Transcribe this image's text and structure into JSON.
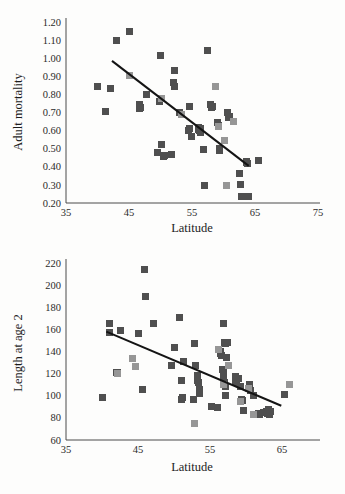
{
  "figure": {
    "background_color": "#fdfdfc",
    "marker_dark_color": "#4f4f4f",
    "marker_light_color": "#969696",
    "axis_color": "#4a4a4a",
    "trend_color": "#141414"
  },
  "chart_data": [
    {
      "type": "scatter",
      "title": "",
      "xlabel": "Latitude",
      "ylabel": "Adult mortality",
      "xlim": [
        35,
        75
      ],
      "ylim": [
        0.2,
        1.2
      ],
      "xticks": [
        35,
        45,
        55,
        65,
        75
      ],
      "yticks": [
        "0.20",
        "0.30",
        "0.40",
        "0.50",
        "0.60",
        "0.70",
        "0.80",
        "0.90",
        "1.00",
        "1.10",
        "1.20"
      ],
      "grid": false,
      "legend": "none",
      "series": [
        {
          "name": "dark",
          "color": "#4f4f4f",
          "points": [
            [
              40.0,
              0.845
            ],
            [
              41.2,
              0.705
            ],
            [
              42.0,
              0.83
            ],
            [
              43.0,
              1.1
            ],
            [
              45.0,
              1.145
            ],
            [
              46.6,
              0.745
            ],
            [
              46.7,
              0.72
            ],
            [
              46.8,
              0.728
            ],
            [
              47.8,
              0.8
            ],
            [
              49.6,
              0.48
            ],
            [
              49.9,
              0.76
            ],
            [
              50.0,
              1.015
            ],
            [
              50.2,
              0.522
            ],
            [
              50.5,
              0.455
            ],
            [
              50.6,
              0.46
            ],
            [
              51.8,
              0.47
            ],
            [
              52.2,
              0.93
            ],
            [
              52.0,
              0.868
            ],
            [
              52.3,
              0.845
            ],
            [
              53.0,
              0.7
            ],
            [
              54.6,
              0.735
            ],
            [
              54.5,
              0.6
            ],
            [
              54.6,
              0.612
            ],
            [
              54.9,
              0.565
            ],
            [
              56.0,
              0.605
            ],
            [
              56.1,
              0.618
            ],
            [
              56.2,
              0.6
            ],
            [
              56.3,
              0.59
            ],
            [
              56.4,
              0.612
            ],
            [
              56.9,
              0.495
            ],
            [
              57.0,
              0.297
            ],
            [
              57.5,
              1.04
            ],
            [
              58.0,
              0.745
            ],
            [
              58.1,
              0.728
            ],
            [
              58.3,
              0.735
            ],
            [
              59.0,
              0.645
            ],
            [
              59.2,
              0.628
            ],
            [
              59.3,
              0.49
            ],
            [
              59.4,
              0.5
            ],
            [
              60.6,
              0.7
            ],
            [
              60.8,
              0.672
            ],
            [
              60.9,
              0.68
            ],
            [
              62.6,
              0.362
            ],
            [
              62.7,
              0.3
            ],
            [
              62.8,
              0.235
            ],
            [
              63.6,
              0.425
            ],
            [
              63.7,
              0.432
            ],
            [
              63.8,
              0.418
            ],
            [
              63.9,
              0.235
            ],
            [
              65.6,
              0.435
            ]
          ]
        },
        {
          "name": "light",
          "color": "#969696",
          "points": [
            [
              45.0,
              0.905
            ],
            [
              50.2,
              0.78
            ],
            [
              53.3,
              0.69
            ],
            [
              58.8,
              0.845
            ],
            [
              59.2,
              0.62
            ],
            [
              60.1,
              0.545
            ],
            [
              60.5,
              0.297
            ],
            [
              61.6,
              0.65
            ]
          ]
        }
      ],
      "trend_line": {
        "x0": 42.3,
        "y0": 0.985,
        "x1": 64.0,
        "y1": 0.405
      }
    },
    {
      "type": "scatter",
      "title": "",
      "xlabel": "Latitude",
      "ylabel": "Length at age 2",
      "xlim": [
        35,
        70
      ],
      "ylim": [
        60,
        220
      ],
      "xticks": [
        35,
        45,
        55,
        65
      ],
      "yticks": [
        60,
        80,
        100,
        120,
        140,
        160,
        180,
        200,
        220
      ],
      "grid": false,
      "legend": "none",
      "series": [
        {
          "name": "dark",
          "color": "#4f4f4f",
          "points": [
            [
              40.0,
              98
            ],
            [
              41.0,
              165
            ],
            [
              41.1,
              157
            ],
            [
              42.0,
              121
            ],
            [
              42.1,
              121
            ],
            [
              42.6,
              159
            ],
            [
              45.0,
              156
            ],
            [
              45.6,
              106
            ],
            [
              45.9,
              214
            ],
            [
              46.0,
              190
            ],
            [
              47.2,
              165
            ],
            [
              49.7,
              127
            ],
            [
              50.0,
              144
            ],
            [
              51.3,
              131
            ],
            [
              51.0,
              114
            ],
            [
              51.1,
              97
            ],
            [
              51.2,
              98
            ],
            [
              50.8,
              171
            ],
            [
              52.8,
              147
            ],
            [
              53.0,
              127
            ],
            [
              52.7,
              97
            ],
            [
              53.2,
              114
            ],
            [
              53.3,
              118
            ],
            [
              53.4,
              112
            ],
            [
              53.5,
              106
            ],
            [
              53.6,
              102
            ],
            [
              55.2,
              90
            ],
            [
              56.0,
              89
            ],
            [
              56.4,
              140
            ],
            [
              56.5,
              138
            ],
            [
              56.6,
              136
            ],
            [
              56.9,
              165
            ],
            [
              57.0,
              148
            ],
            [
              57.1,
              147
            ],
            [
              57.3,
              135
            ],
            [
              56.8,
              124
            ],
            [
              56.9,
              122
            ],
            [
              56.9,
              118
            ],
            [
              57.0,
              112
            ],
            [
              57.1,
              108
            ],
            [
              57.2,
              100
            ],
            [
              57.4,
              148
            ],
            [
              58.5,
              117
            ],
            [
              58.6,
              114
            ],
            [
              58.7,
              112
            ],
            [
              59.0,
              116
            ],
            [
              59.3,
              108
            ],
            [
              59.4,
              97
            ],
            [
              59.5,
              96
            ],
            [
              59.6,
              87
            ],
            [
              60.5,
              110
            ],
            [
              60.6,
              105
            ],
            [
              61.0,
              100
            ],
            [
              61.8,
              84
            ],
            [
              61.9,
              83
            ],
            [
              62.4,
              85
            ],
            [
              62.9,
              86
            ],
            [
              63.0,
              84
            ],
            [
              63.1,
              88
            ],
            [
              63.2,
              85
            ],
            [
              63.3,
              83
            ],
            [
              63.4,
              86
            ],
            [
              65.4,
              101
            ]
          ]
        },
        {
          "name": "light",
          "color": "#969696",
          "points": [
            [
              42.2,
              120
            ],
            [
              44.2,
              134
            ],
            [
              44.6,
              126
            ],
            [
              52.8,
              75
            ],
            [
              56.2,
              142
            ],
            [
              56.9,
              110
            ],
            [
              57.6,
              127
            ],
            [
              59.2,
              95
            ],
            [
              60.4,
              107
            ],
            [
              61.0,
              83
            ],
            [
              66.0,
              110
            ]
          ]
        }
      ],
      "trend_line": {
        "x0": 40.6,
        "y0": 158,
        "x1": 64.9,
        "y1": 91
      }
    }
  ]
}
